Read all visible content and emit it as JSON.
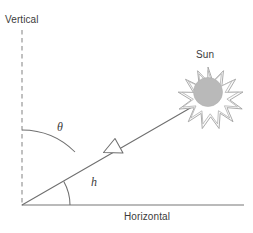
{
  "figure": {
    "type": "solar-geometry-diagram",
    "background_color": "#ffffff",
    "line_color": "#6b6b6b",
    "text_color": "#3b3b3b",
    "sun_fill_color": "#b8b8b8",
    "sun_ray_outline_color": "#9a9a9a"
  },
  "labels": {
    "vertical": "Vertical",
    "horizontal": "Horizontal",
    "sun": "Sun",
    "zenith_angle_symbol": "θ",
    "altitude_angle_symbol": "h"
  },
  "geometry": {
    "origin": {
      "x": 22,
      "y": 205
    },
    "vertical_axis": {
      "x": 22,
      "y_top": 30,
      "y_bottom": 205,
      "style": "dashed"
    },
    "horizontal_axis": {
      "y": 205,
      "x_start": 22,
      "x_end": 244,
      "style": "solid"
    },
    "sun_ray": {
      "x1": 22,
      "y1": 205,
      "x2": 192,
      "y2": 107,
      "style": "solid"
    },
    "arrowhead": {
      "x": 112,
      "y": 148,
      "direction": "toward-origin",
      "fill": "none"
    },
    "zenith_arc": {
      "radius": 75,
      "from": "vertical",
      "to": "sun-ray"
    },
    "altitude_arc": {
      "radius": 48,
      "from": "sun-ray",
      "to": "horizontal"
    },
    "sun": {
      "cx": 208,
      "cy": 92,
      "inner_radius": 14,
      "outer_radius": 25,
      "ray_count": 14
    }
  }
}
